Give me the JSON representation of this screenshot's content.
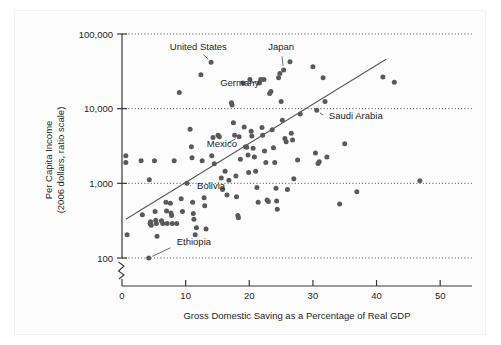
{
  "figure": {
    "background_color": "#ffffff",
    "point_color": "#5a5a5a",
    "axis_color": "#3a3a3a",
    "grid_color": "#4a4a4a",
    "text_color": "#1d1d1d"
  },
  "chart_data": {
    "type": "scatter",
    "title": "",
    "xlabel": "Gross Domestic Saving as a Percentage of Real GDP",
    "ylabel": "Per Capita Income\n(2006 dollars, ratio scale)",
    "ylabel_line1": "Per Capita Income",
    "ylabel_line2": "(2006 dollars, ratio scale)",
    "yscale": "log",
    "xscale": "linear",
    "xlim": [
      0,
      55
    ],
    "ylim": [
      100,
      100000
    ],
    "grid": "horizontal-dotted",
    "legend": "none",
    "axis_break": true,
    "xticks": [
      0,
      10,
      20,
      30,
      40,
      50
    ],
    "xtick_labels": [
      "0",
      "10",
      "20",
      "30",
      "40",
      "50"
    ],
    "yticks": [
      100,
      1000,
      10000,
      100000
    ],
    "ytick_labels": [
      "100",
      "1,000",
      "10,000",
      "100,000"
    ],
    "trendline": {
      "x_start": 0.6,
      "y_start": 330,
      "x_end": 41.5,
      "y_end": 46000
    },
    "annotations": [
      {
        "label": "United States",
        "text_x": 12.0,
        "text_y": 62000,
        "point_x": 14.0,
        "point_y": 42000
      },
      {
        "label": "Japan",
        "text_x": 25.0,
        "text_y": 62000,
        "point_x": 25.4,
        "point_y": 33000
      },
      {
        "label": "Germany",
        "text_x": 18.5,
        "text_y": 20000,
        "point_x": 22.3,
        "point_y": 24500
      },
      {
        "label": "Saudi Arabia",
        "text_x": 32.5,
        "text_y": 7200,
        "point_x": 30.6,
        "point_y": 9500
      },
      {
        "label": "Mexico",
        "text_x": 15.7,
        "text_y": 3100,
        "point_x": 18.4,
        "point_y": 4200
      },
      {
        "label": "Bolivia",
        "text_x": 11.8,
        "text_y": 830,
        "point_x": 10.2,
        "point_y": 1000
      },
      {
        "label": "Ethiopia",
        "text_x": 8.6,
        "text_y": 150,
        "point_x": 4.2,
        "point_y": 100
      }
    ],
    "points": [
      {
        "x": 0.6,
        "y": 2350
      },
      {
        "x": 0.6,
        "y": 1900
      },
      {
        "x": 0.8,
        "y": 205
      },
      {
        "x": 3.0,
        "y": 2000
      },
      {
        "x": 3.2,
        "y": 380
      },
      {
        "x": 4.2,
        "y": 100
      },
      {
        "x": 4.3,
        "y": 1120
      },
      {
        "x": 4.4,
        "y": 290
      },
      {
        "x": 4.5,
        "y": 305
      },
      {
        "x": 4.6,
        "y": 275
      },
      {
        "x": 5.1,
        "y": 2000
      },
      {
        "x": 5.2,
        "y": 420
      },
      {
        "x": 5.3,
        "y": 320
      },
      {
        "x": 5.4,
        "y": 290
      },
      {
        "x": 5.5,
        "y": 195
      },
      {
        "x": 6.2,
        "y": 315
      },
      {
        "x": 6.4,
        "y": 290
      },
      {
        "x": 6.9,
        "y": 560
      },
      {
        "x": 7.0,
        "y": 425
      },
      {
        "x": 7.1,
        "y": 290
      },
      {
        "x": 7.6,
        "y": 540
      },
      {
        "x": 7.7,
        "y": 400
      },
      {
        "x": 7.8,
        "y": 370
      },
      {
        "x": 7.9,
        "y": 290
      },
      {
        "x": 8.2,
        "y": 2000
      },
      {
        "x": 8.6,
        "y": 290
      },
      {
        "x": 9.0,
        "y": 16500
      },
      {
        "x": 9.3,
        "y": 620
      },
      {
        "x": 9.5,
        "y": 420
      },
      {
        "x": 10.2,
        "y": 1000
      },
      {
        "x": 10.7,
        "y": 5300
      },
      {
        "x": 10.9,
        "y": 3100
      },
      {
        "x": 11.0,
        "y": 2200
      },
      {
        "x": 11.1,
        "y": 560
      },
      {
        "x": 11.2,
        "y": 395
      },
      {
        "x": 11.3,
        "y": 330
      },
      {
        "x": 11.5,
        "y": 205
      },
      {
        "x": 11.7,
        "y": 255
      },
      {
        "x": 12.4,
        "y": 28500
      },
      {
        "x": 12.6,
        "y": 2000
      },
      {
        "x": 12.9,
        "y": 640
      },
      {
        "x": 13.0,
        "y": 500
      },
      {
        "x": 13.2,
        "y": 245
      },
      {
        "x": 14.0,
        "y": 42000
      },
      {
        "x": 14.1,
        "y": 2350
      },
      {
        "x": 14.3,
        "y": 4100
      },
      {
        "x": 14.5,
        "y": 1830
      },
      {
        "x": 15.1,
        "y": 4400
      },
      {
        "x": 15.3,
        "y": 4200
      },
      {
        "x": 15.6,
        "y": 1180
      },
      {
        "x": 15.8,
        "y": 830
      },
      {
        "x": 16.2,
        "y": 1450
      },
      {
        "x": 16.5,
        "y": 700
      },
      {
        "x": 16.8,
        "y": 1100
      },
      {
        "x": 17.2,
        "y": 12000
      },
      {
        "x": 17.3,
        "y": 11200
      },
      {
        "x": 17.5,
        "y": 6500
      },
      {
        "x": 17.7,
        "y": 4400
      },
      {
        "x": 17.9,
        "y": 1250
      },
      {
        "x": 18.0,
        "y": 660
      },
      {
        "x": 18.2,
        "y": 370
      },
      {
        "x": 18.3,
        "y": 345
      },
      {
        "x": 18.4,
        "y": 4200
      },
      {
        "x": 18.6,
        "y": 2100
      },
      {
        "x": 19.0,
        "y": 22000
      },
      {
        "x": 19.2,
        "y": 5700
      },
      {
        "x": 19.4,
        "y": 3100
      },
      {
        "x": 19.6,
        "y": 3050
      },
      {
        "x": 19.8,
        "y": 2400
      },
      {
        "x": 19.9,
        "y": 1400
      },
      {
        "x": 20.1,
        "y": 24500
      },
      {
        "x": 20.3,
        "y": 5000
      },
      {
        "x": 20.4,
        "y": 4300
      },
      {
        "x": 20.6,
        "y": 2950
      },
      {
        "x": 20.8,
        "y": 2250
      },
      {
        "x": 21.0,
        "y": 1450
      },
      {
        "x": 21.2,
        "y": 880
      },
      {
        "x": 21.4,
        "y": 560
      },
      {
        "x": 21.6,
        "y": 22000
      },
      {
        "x": 21.8,
        "y": 24500
      },
      {
        "x": 22.0,
        "y": 5600
      },
      {
        "x": 22.1,
        "y": 4400
      },
      {
        "x": 22.3,
        "y": 24500
      },
      {
        "x": 22.4,
        "y": 2700
      },
      {
        "x": 22.6,
        "y": 1900
      },
      {
        "x": 22.8,
        "y": 600
      },
      {
        "x": 23.0,
        "y": 570
      },
      {
        "x": 23.2,
        "y": 16000
      },
      {
        "x": 23.4,
        "y": 17000
      },
      {
        "x": 23.6,
        "y": 5200
      },
      {
        "x": 23.8,
        "y": 3000
      },
      {
        "x": 24.0,
        "y": 1900
      },
      {
        "x": 24.2,
        "y": 860
      },
      {
        "x": 24.3,
        "y": 580
      },
      {
        "x": 24.4,
        "y": 450
      },
      {
        "x": 24.6,
        "y": 26000
      },
      {
        "x": 24.8,
        "y": 29500
      },
      {
        "x": 25.0,
        "y": 12500
      },
      {
        "x": 25.2,
        "y": 7000
      },
      {
        "x": 25.4,
        "y": 33000
      },
      {
        "x": 25.6,
        "y": 4000
      },
      {
        "x": 25.8,
        "y": 3600
      },
      {
        "x": 26.0,
        "y": 830
      },
      {
        "x": 26.4,
        "y": 42500
      },
      {
        "x": 26.6,
        "y": 4700
      },
      {
        "x": 26.8,
        "y": 3800
      },
      {
        "x": 27.0,
        "y": 1150
      },
      {
        "x": 27.6,
        "y": 2050
      },
      {
        "x": 28.0,
        "y": 8500
      },
      {
        "x": 30.0,
        "y": 36500
      },
      {
        "x": 30.4,
        "y": 2550
      },
      {
        "x": 30.6,
        "y": 9500
      },
      {
        "x": 30.8,
        "y": 1850
      },
      {
        "x": 31.0,
        "y": 1950
      },
      {
        "x": 31.6,
        "y": 26000
      },
      {
        "x": 31.9,
        "y": 12500
      },
      {
        "x": 32.2,
        "y": 2250
      },
      {
        "x": 34.2,
        "y": 530
      },
      {
        "x": 35.0,
        "y": 3400
      },
      {
        "x": 36.9,
        "y": 770
      },
      {
        "x": 41.0,
        "y": 26500
      },
      {
        "x": 42.8,
        "y": 22500
      },
      {
        "x": 46.8,
        "y": 1080
      }
    ]
  }
}
